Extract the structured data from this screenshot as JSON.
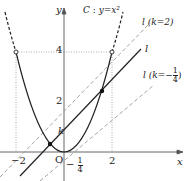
{
  "figure": {
    "curve_label": "C : y=x²",
    "curve_name": "C",
    "curve_equation": "y=x²",
    "axes": {
      "x_label": "x",
      "y_label": "y",
      "origin_label": "O"
    },
    "ticks": {
      "x_neg2": "−2",
      "x_pos2": "2",
      "y_4": "4",
      "y_2": "2",
      "k_label": "k"
    },
    "fraction_quarter": {
      "num": "1",
      "den": "4",
      "sign": "−"
    },
    "lines": {
      "l": "l",
      "l_k2_name": "l",
      "l_k2_cond": "(k=2)",
      "l_kq_name": "l",
      "l_kq_prefix": "(k=",
      "l_kq_sign": "−",
      "l_kq_num": "1",
      "l_kq_den": "4",
      "l_kq_suffix": ")"
    },
    "colors": {
      "curve": "#2a2a2a",
      "dashed_lines": "#9a9a9a",
      "axes": "#555555",
      "dotted_guides": "#999999"
    }
  }
}
